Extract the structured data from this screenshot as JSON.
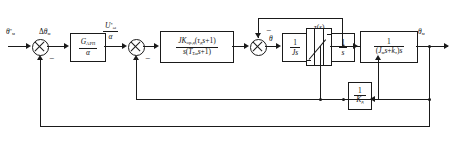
{
  "diagram": {
    "type": "block-diagram",
    "input_label": "θ*м",
    "output_label": "θм",
    "signals": {
      "error": "Δθм",
      "speed_ref": "U*ω/α",
      "omega": "ω",
      "theta": "θ",
      "saturation": "τ(s)"
    },
    "blocks": [
      {
        "name": "position-regulator",
        "numerator": "GАРП",
        "denominator": "α"
      },
      {
        "name": "speed-regulator",
        "numerator": "JKор.д(τдs+1)",
        "denominator": "s(TΣиs+1)"
      },
      {
        "name": "inertia-integrator",
        "numerator": "1",
        "denominator": "Js"
      },
      {
        "name": "position-integrator",
        "numerator": "1",
        "denominator": "s"
      },
      {
        "name": "mechanical-plant",
        "numerator": "1",
        "denominator": "(Jмs+kт)s"
      },
      {
        "name": "stiffness-feedback",
        "numerator": "1",
        "denominator": "Kд"
      }
    ],
    "summing_junctions": [
      {
        "name": "sum-1",
        "sign": "−"
      },
      {
        "name": "sum-2",
        "sign": "−"
      },
      {
        "name": "sum-3",
        "sign": "−"
      },
      {
        "name": "sum-4",
        "sign": "−"
      }
    ],
    "saturation_label": "τ(s)"
  }
}
